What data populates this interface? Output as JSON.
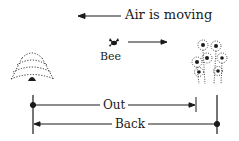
{
  "diagram": {
    "air_label": "Air is moving",
    "bee_label": "Bee",
    "out_label": "Out",
    "back_label": "Back",
    "icons": {
      "hive": "beehive-icon",
      "bee": "bee-icon",
      "flowers": "flowers-icon"
    },
    "colors": {
      "ink": "#1a1a1a",
      "background": "#ffffff"
    }
  }
}
